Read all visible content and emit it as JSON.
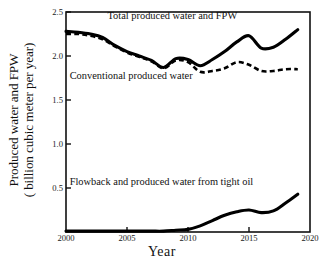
{
  "chart_data": {
    "type": "line",
    "title": "",
    "xlabel": "Year",
    "ylabel": "Produced water and FPW ( billion cubic meter per year)",
    "ylabel_line1": "Produced water and FPW",
    "ylabel_line2": "( billion cubic meter per year)",
    "xlim": [
      2000,
      2020
    ],
    "ylim": [
      0,
      2.5
    ],
    "xticks": [
      2000,
      2005,
      2010,
      2015,
      2020
    ],
    "xtick_labels": [
      "2000",
      "2005",
      "2010",
      "2015",
      "2020"
    ],
    "yticks": [
      0.5,
      1.0,
      1.5,
      2.0,
      2.5
    ],
    "ytick_labels": [
      "0.5",
      "1.0",
      "1.5",
      "2.0",
      "2.5"
    ],
    "grid": false,
    "legend_position": "inline-annotations",
    "x": [
      2000,
      2001,
      2002,
      2003,
      2004,
      2005,
      2006,
      2007,
      2008,
      2009,
      2010,
      2011,
      2012,
      2013,
      2014,
      2015,
      2016,
      2017,
      2018,
      2019
    ],
    "series": [
      {
        "name": "Total produced water and FPW",
        "style": "solid",
        "color": "#000000",
        "values": [
          2.28,
          2.27,
          2.25,
          2.21,
          2.12,
          2.05,
          2.0,
          1.95,
          1.87,
          1.97,
          1.96,
          1.89,
          1.96,
          2.05,
          2.16,
          2.23,
          2.09,
          2.1,
          2.19,
          2.3
        ]
      },
      {
        "name": "Conventional produced water",
        "style": "dashed",
        "color": "#000000",
        "values": [
          2.25,
          2.25,
          2.23,
          2.19,
          2.11,
          2.04,
          1.99,
          1.94,
          1.86,
          1.95,
          1.93,
          1.82,
          1.83,
          1.86,
          1.93,
          1.9,
          1.83,
          1.83,
          1.85,
          1.85
        ]
      },
      {
        "name": "Flowback and produced water from tight oil",
        "style": "solid",
        "color": "#000000",
        "values": [
          0.01,
          0.01,
          0.01,
          0.01,
          0.01,
          0.01,
          0.01,
          0.01,
          0.01,
          0.02,
          0.03,
          0.07,
          0.13,
          0.19,
          0.23,
          0.25,
          0.22,
          0.24,
          0.33,
          0.43
        ]
      }
    ],
    "annotations": [
      {
        "text": "Total produced water and FPW",
        "x": 2003.4,
        "y": 2.42
      },
      {
        "text": "Conventional produced water",
        "x": 2000.3,
        "y": 1.74
      },
      {
        "text": "Flowback and produced water from tight oil",
        "x": 2000.3,
        "y": 0.54
      }
    ]
  }
}
